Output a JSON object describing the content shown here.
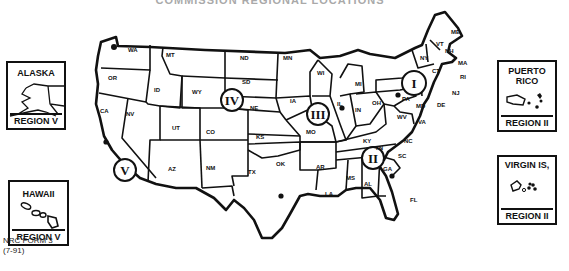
{
  "title": "COMMISSION REGIONAL LOCATIONS",
  "insets": {
    "alaska": {
      "name": "ALASKA",
      "region": "REGION V"
    },
    "hawaii": {
      "name": "HAWAII",
      "region": "REGION V"
    },
    "puerto_rico": {
      "name_line1": "PUERTO",
      "name_line2": "RICO",
      "region": "REGION II"
    },
    "virgin_islands": {
      "name": "VIRGIN IS,",
      "region": "REGION II"
    }
  },
  "form": {
    "line1": "NRC FORM 3",
    "line2": "(7-91)"
  },
  "regions": [
    {
      "numeral": "I",
      "office_state": "PA"
    },
    {
      "numeral": "II",
      "office_state": "GA"
    },
    {
      "numeral": "III",
      "office_state": "IL"
    },
    {
      "numeral": "IV",
      "office_state": "TX"
    },
    {
      "numeral": "V",
      "office_state": "CA"
    }
  ],
  "states": {
    "WA": "WA",
    "OR": "OR",
    "CA": "CA",
    "NV": "NV",
    "ID": "ID",
    "MT": "MT",
    "WY": "WY",
    "UT": "UT",
    "CO": "CO",
    "AZ": "AZ",
    "NM": "NM",
    "ND": "ND",
    "SD": "SD",
    "NE": "NE",
    "KS": "KS",
    "OK": "OK",
    "TX": "TX",
    "MN": "MN",
    "IA": "IA",
    "MO": "MO",
    "AR": "AR",
    "LA": "LA",
    "WI": "WI",
    "IL": "IL",
    "MI": "MI",
    "IN": "IN",
    "OH": "OH",
    "KY": "KY",
    "TN": "TN",
    "MS": "MS",
    "AL": "AL",
    "GA": "GA",
    "FL": "FL",
    "SC": "SC",
    "NC": "NC",
    "VA": "VA",
    "WV": "WV",
    "MD": "MD",
    "DE": "DE",
    "PA": "PA",
    "NJ": "NJ",
    "NY": "NY",
    "CT": "CT",
    "RI": "RI",
    "MA": "MA",
    "VT": "VT",
    "NH": "NH",
    "ME": "ME"
  },
  "colors": {
    "ink": "#111111",
    "paper": "#ffffff"
  }
}
